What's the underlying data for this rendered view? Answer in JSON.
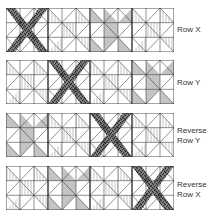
{
  "diagram": {
    "colors": {
      "line": "#222222",
      "dark": "#5a5a5a",
      "gray": "#c4c4c4",
      "background": "#ffffff"
    },
    "rows": [
      {
        "label_line1": "Row X",
        "label_line2": "",
        "blocks": [
          "dark-x",
          "striped",
          "gray-star",
          "striped"
        ]
      },
      {
        "label_line1": "Row Y",
        "label_line2": "",
        "blocks": [
          "striped",
          "dark-x",
          "striped",
          "gray-star"
        ]
      },
      {
        "label_line1": "Reverse",
        "label_line2": "Row Y",
        "blocks": [
          "gray-star",
          "striped",
          "dark-x",
          "striped"
        ]
      },
      {
        "label_line1": "Reverse",
        "label_line2": "Row X",
        "blocks": [
          "striped",
          "gray-star",
          "striped",
          "dark-x"
        ]
      }
    ]
  }
}
